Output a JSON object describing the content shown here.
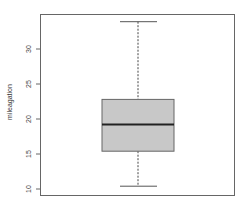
{
  "chart_data": {
    "type": "boxplot",
    "title": "",
    "xlabel": "",
    "ylabel": "mileagation",
    "yticks": [
      10,
      15,
      20,
      25,
      30
    ],
    "ylim": [
      9.2,
      35.4
    ],
    "grid": false,
    "legend": null,
    "series": [
      {
        "name": "",
        "min": 10.4,
        "q1": 15.4,
        "median": 19.2,
        "q3": 22.8,
        "max": 33.9
      }
    ],
    "colors": {
      "box_fill": "#c8c8c8",
      "frame": "#666666",
      "median": "#222222"
    }
  }
}
